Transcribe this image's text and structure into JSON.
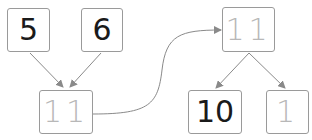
{
  "diagram": {
    "type": "number-bond-tree",
    "nodes": [
      {
        "id": "n5",
        "label": "5",
        "style": "dark"
      },
      {
        "id": "n6",
        "label": "6",
        "style": "dark"
      },
      {
        "id": "n11a",
        "label": "11",
        "style": "faded"
      },
      {
        "id": "n11b",
        "label": "11",
        "style": "faded"
      },
      {
        "id": "n10",
        "label": "10",
        "style": "dark"
      },
      {
        "id": "n1",
        "label": "1",
        "style": "faded"
      }
    ],
    "edges": [
      {
        "from": "n5",
        "to": "n11a"
      },
      {
        "from": "n6",
        "to": "n11a"
      },
      {
        "from": "n11a",
        "to": "n11b",
        "curved": true
      },
      {
        "from": "n11b",
        "to": "n10"
      },
      {
        "from": "n11b",
        "to": "n1"
      }
    ]
  },
  "colors": {
    "border": "#9a9a9a",
    "arrow": "#8a8a8a",
    "text_dark": "#1a1a1a",
    "text_faded": "#b8b8b8"
  }
}
